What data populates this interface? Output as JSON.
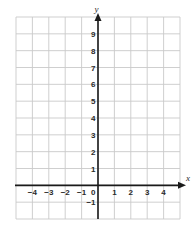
{
  "chart_data": {
    "type": "coordinate-grid",
    "title": "",
    "xlabel": "x",
    "ylabel": "y",
    "xlim": [
      -5,
      5
    ],
    "ylim": [
      -2,
      10
    ],
    "grid": true,
    "x_tick_labels": [
      "−4",
      "−3",
      "−2",
      "−1",
      "0",
      "1",
      "2",
      "3",
      "4"
    ],
    "x_tick_values": [
      -4,
      -3,
      -2,
      -1,
      0,
      1,
      2,
      3,
      4
    ],
    "y_tick_labels": [
      "9",
      "8",
      "7",
      "6",
      "5",
      "4",
      "3",
      "2",
      "1",
      "−1"
    ],
    "y_tick_values": [
      9,
      8,
      7,
      6,
      5,
      4,
      3,
      2,
      1,
      -1
    ],
    "series": [],
    "legend": null
  },
  "colors": {
    "grid": "#c9c9c9",
    "axis": "#1a1a1a",
    "text": "#2a2a2a",
    "background": "#ffffff"
  }
}
